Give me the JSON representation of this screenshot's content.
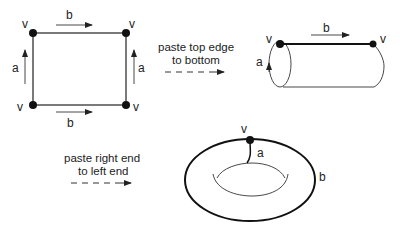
{
  "square": {
    "vertex_label": "v",
    "top_edge_label": "b",
    "bottom_edge_label": "b",
    "left_edge_label": "a",
    "right_edge_label": "a",
    "vertices": [
      "v",
      "v",
      "v",
      "v"
    ]
  },
  "step1": {
    "caption_line1": "paste top edge",
    "caption_line2": "to bottom"
  },
  "cylinder": {
    "left_vertex_label": "v",
    "right_vertex_label": "v",
    "top_edge_label": "b",
    "loop_label": "a"
  },
  "step2": {
    "caption_line1": "paste right end",
    "caption_line2": "to left end"
  },
  "torus": {
    "vertex_label": "v",
    "meridian_label": "a",
    "longitude_label": "b"
  },
  "colors": {
    "stroke": "#333333",
    "vertex": "#111111",
    "background": "#ffffff"
  }
}
